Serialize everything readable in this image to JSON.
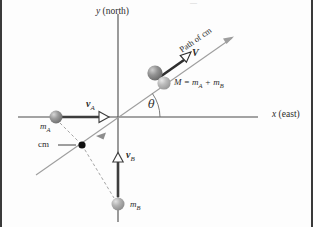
{
  "figure": {
    "type": "physics-vector-diagram",
    "background_color": "#fdfdfd",
    "frame_color": "#3a3a3a"
  },
  "axes": {
    "x_label_text": "x (east)",
    "x_label_italic": "x",
    "x_label_rest": " (east)",
    "y_label_text": "y (north)",
    "y_label_italic": "y",
    "y_label_rest": " (north)",
    "axis_color": "#4a4a4a",
    "origin": {
      "x": 118,
      "y": 117
    }
  },
  "path": {
    "label": "Path of cm",
    "color": "#9a9a9a",
    "angle_label": "θ",
    "angle_deg": 35
  },
  "bodies": [
    {
      "name": "mass-a",
      "label_italic": "m",
      "label_sub": "A",
      "color": "#8f8f8f",
      "cx": 56,
      "cy": 117,
      "r": 6.5
    },
    {
      "name": "mass-b",
      "label_italic": "m",
      "label_sub": "B",
      "color": "#a9a9a9",
      "cx": 118,
      "cy": 204,
      "r": 6.5
    },
    {
      "name": "combined-mass-upper",
      "color": "#8a8a8a",
      "cx": 155,
      "cy": 73,
      "r": 7.5
    },
    {
      "name": "combined-mass-lower",
      "color": "#b0b0b0",
      "cx": 164,
      "cy": 82,
      "r": 6.5
    }
  ],
  "vectors": [
    {
      "name": "velocity-a",
      "label_bold": "v",
      "label_sub": "A",
      "color": "#3d3d3d",
      "from": {
        "x": 62,
        "y": 117
      },
      "to": {
        "x": 106,
        "y": 117
      }
    },
    {
      "name": "velocity-b",
      "label_bold": "v",
      "label_sub": "B",
      "color": "#3d3d3d",
      "from": {
        "x": 118,
        "y": 196
      },
      "to": {
        "x": 118,
        "y": 155
      }
    },
    {
      "name": "velocity-combined",
      "label_bold": "V",
      "label_sub": "",
      "color": "#2e2e2e",
      "from": {
        "x": 159,
        "y": 77
      },
      "to": {
        "x": 190,
        "y": 56
      }
    }
  ],
  "center_of_mass": {
    "label": "cm",
    "dot_color": "#101010",
    "x": 82,
    "y": 145
  },
  "mass_equation": {
    "m": "M",
    "eq": " = ",
    "m1": "m",
    "m1_sub": "A",
    "plus": " + ",
    "m2": "m",
    "m2_sub": "B"
  }
}
